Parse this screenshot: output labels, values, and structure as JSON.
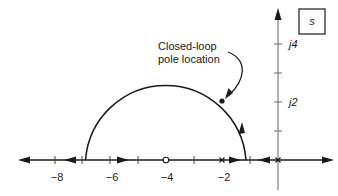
{
  "diagram": {
    "type": "root-locus",
    "plane_label": "s",
    "annotation": {
      "line1": "Closed-loop",
      "line2": "pole location"
    },
    "real_axis": {
      "tick_labels": [
        "−8",
        "−6",
        "−4",
        "−2"
      ],
      "tick_values": [
        -8,
        -7,
        -6,
        -5,
        -4,
        -3,
        -2,
        -1,
        0
      ]
    },
    "imag_axis": {
      "tick_labels": [
        "j2",
        "j4"
      ],
      "tick_values": [
        1,
        2,
        3,
        4
      ]
    },
    "open_loop_poles": [
      -2,
      0
    ],
    "open_loop_zeros": [
      -4
    ],
    "breakaway_points": [
      -1.1
    ],
    "break_in_points": [
      -6.9
    ],
    "closed_loop_pole": {
      "re": -2.0,
      "im": 2.1
    },
    "colors": {
      "line": "#1a1a1a",
      "axis": "#555555",
      "background": "#ffffff"
    }
  }
}
